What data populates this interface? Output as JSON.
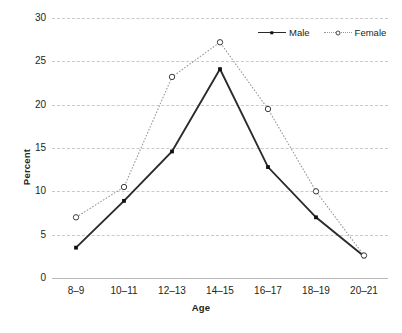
{
  "chart_data": {
    "type": "line",
    "title": "",
    "xlabel": "Age",
    "ylabel": "Percent",
    "categories": [
      "8–9",
      "10–11",
      "12–13",
      "14–15",
      "16–17",
      "18–19",
      "20–21"
    ],
    "yticks": [
      0,
      5,
      10,
      15,
      20,
      25,
      30
    ],
    "ylim": [
      0,
      30
    ],
    "grid": true,
    "legend_position": "top-right",
    "series": [
      {
        "name": "Male",
        "values": [
          3.5,
          8.9,
          14.6,
          24.1,
          12.8,
          7.0,
          2.5
        ],
        "line_style": "solid",
        "marker": "filled-square",
        "color": "#2b2b2b"
      },
      {
        "name": "Female",
        "values": [
          7.0,
          10.5,
          23.2,
          27.2,
          19.5,
          10.0,
          2.6
        ],
        "line_style": "dotted",
        "marker": "open-circle",
        "color": "#9a9a9a"
      }
    ]
  },
  "legend": {
    "entries": [
      {
        "label": "Male"
      },
      {
        "label": "Female"
      }
    ]
  },
  "colors": {
    "male_line": "#2b2b2b",
    "female_line": "#9a9a9a",
    "gridline": "#c9c9c9",
    "text": "#231f20",
    "background": "#ffffff"
  }
}
